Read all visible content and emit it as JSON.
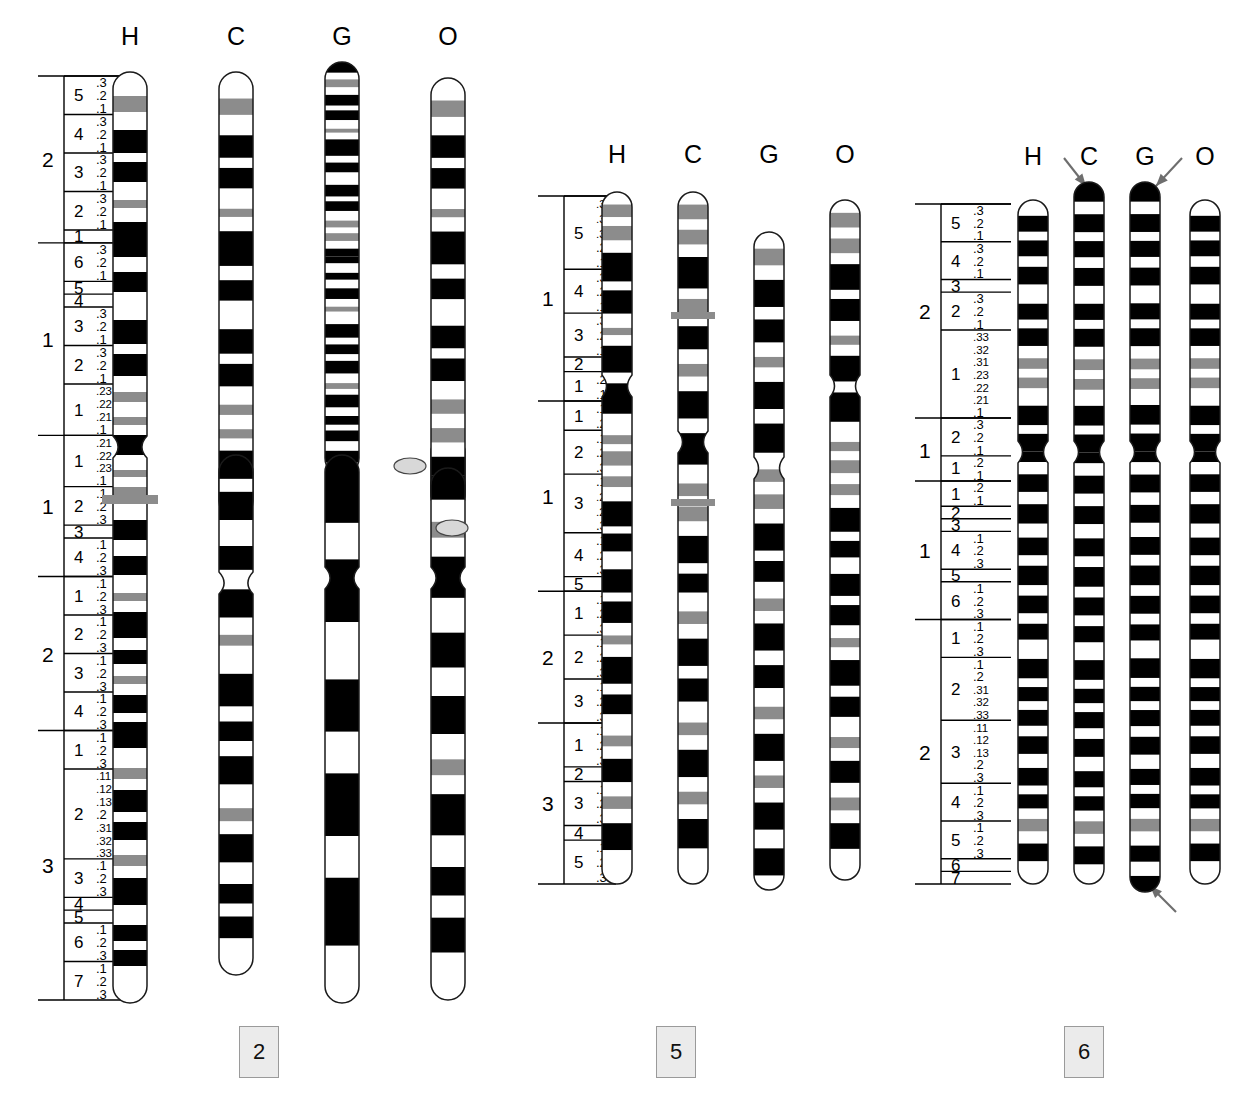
{
  "figure": {
    "type": "ideogram",
    "species_codes": [
      "H",
      "C",
      "G",
      "O"
    ],
    "species_names": {
      "H": "Human",
      "C": "Chimpanzee",
      "G": "Gorilla",
      "O": "Orangutan"
    },
    "band_colors": {
      "negative": "#ffffff",
      "positive": "#000000",
      "variable": "#8c8c8c",
      "outline": "#1a1a1a",
      "chip_fill": "#ebebeb",
      "chip_border": "#9a9a9a",
      "arrow": "#6e6e6e",
      "marker": "#8c8c8c"
    }
  },
  "panels": [
    {
      "id": "chr2",
      "chip_label": "2",
      "headers": [
        "H",
        "C",
        "G",
        "O"
      ],
      "arms": [
        {
          "label": "2",
          "regions": [
            {
              "label": "5",
              "bands": [
                ".3",
                ".2",
                ".1"
              ]
            },
            {
              "label": "4",
              "bands": [
                ".3",
                ".2",
                ".1"
              ]
            },
            {
              "label": "3",
              "bands": [
                ".3",
                ".2",
                ".1"
              ]
            },
            {
              "label": "2",
              "bands": [
                ".3",
                ".2",
                ".1"
              ]
            },
            {
              "label": "1",
              "bands": []
            }
          ]
        },
        {
          "label": "1",
          "regions": [
            {
              "label": "6",
              "bands": [
                ".3",
                ".2",
                ".1"
              ]
            },
            {
              "label": "5",
              "bands": []
            },
            {
              "label": "4",
              "bands": []
            },
            {
              "label": "3",
              "bands": [
                ".3",
                ".2",
                ".1"
              ]
            },
            {
              "label": "2",
              "bands": [
                ".3",
                ".2",
                ".1"
              ]
            },
            {
              "label": "1",
              "bands": [
                ".23",
                ".22",
                ".21",
                ".1"
              ]
            }
          ]
        },
        {
          "label": "1",
          "regions": [
            {
              "label": "1",
              "bands": [
                ".21",
                ".22",
                ".23",
                ".1"
              ]
            },
            {
              "label": "2",
              "bands": [
                ".1",
                ".2",
                ".3"
              ]
            },
            {
              "label": "3",
              "bands": []
            },
            {
              "label": "4",
              "bands": [
                ".1",
                ".2",
                ".3"
              ]
            }
          ]
        },
        {
          "label": "2",
          "regions": [
            {
              "label": "1",
              "bands": [
                ".1",
                ".2",
                ".3"
              ]
            },
            {
              "label": "2",
              "bands": [
                ".1",
                ".2",
                ".3"
              ]
            },
            {
              "label": "3",
              "bands": [
                ".1",
                ".2",
                ".3"
              ]
            },
            {
              "label": "4",
              "bands": [
                ".1",
                ".2",
                ".3"
              ]
            }
          ]
        },
        {
          "label": "3",
          "regions": [
            {
              "label": "1",
              "bands": [
                ".1",
                ".2",
                ".3"
              ]
            },
            {
              "label": "2",
              "bands": [
                ".11",
                ".12",
                ".13",
                ".2",
                ".31",
                ".32",
                ".33"
              ]
            },
            {
              "label": "3",
              "bands": [
                ".1",
                ".2",
                ".3"
              ]
            },
            {
              "label": "4",
              "bands": []
            },
            {
              "label": "5",
              "bands": []
            },
            {
              "label": "6",
              "bands": [
                ".1",
                ".2",
                ".3"
              ]
            },
            {
              "label": "7",
              "bands": [
                ".1",
                ".2",
                ".3"
              ]
            }
          ]
        }
      ]
    },
    {
      "id": "chr5",
      "chip_label": "5",
      "headers": [
        "H",
        "C",
        "G",
        "O"
      ],
      "arms": [
        {
          "label": "1",
          "regions": [
            {
              "label": "5",
              "bands": [
                ".33",
                ".32",
                ".31",
                ".2",
                ".1"
              ]
            },
            {
              "label": "4",
              "bands": [
                ".3",
                ".2",
                ".1"
              ]
            },
            {
              "label": "3",
              "bands": [
                ".3",
                ".2",
                ".1"
              ]
            },
            {
              "label": "2",
              "bands": []
            },
            {
              "label": "1",
              "bands": [
                ".2",
                ".1"
              ]
            }
          ]
        },
        {
          "label": "1",
          "regions": [
            {
              "label": "1",
              "bands": [
                ".1",
                ".2"
              ]
            },
            {
              "label": "2",
              "bands": [
                ".1",
                ".2",
                ".3"
              ]
            },
            {
              "label": "3",
              "bands": [
                ".1",
                ".21",
                ".22",
                ".3"
              ]
            },
            {
              "label": "4",
              "bands": [
                ".1",
                ".2",
                ".3"
              ]
            },
            {
              "label": "5",
              "bands": []
            }
          ]
        },
        {
          "label": "2",
          "regions": [
            {
              "label": "1",
              "bands": [
                ".1",
                ".2",
                ".3"
              ]
            },
            {
              "label": "2",
              "bands": [
                ".1",
                ".2",
                ".3"
              ]
            },
            {
              "label": "3",
              "bands": [
                ".1",
                ".2",
                ".3"
              ]
            }
          ]
        },
        {
          "label": "3",
          "regions": [
            {
              "label": "1",
              "bands": [
                ".1",
                ".2",
                ".3"
              ]
            },
            {
              "label": "2",
              "bands": []
            },
            {
              "label": "3",
              "bands": [
                ".1",
                ".2",
                ".3"
              ]
            },
            {
              "label": "4",
              "bands": []
            },
            {
              "label": "5",
              "bands": [
                ".1",
                ".2",
                ".3"
              ]
            }
          ]
        }
      ]
    },
    {
      "id": "chr6",
      "chip_label": "6",
      "headers": [
        "H",
        "C",
        "G",
        "O"
      ],
      "arms": [
        {
          "label": "2",
          "regions": [
            {
              "label": "5",
              "bands": [
                ".3",
                ".2",
                ".1"
              ]
            },
            {
              "label": "4",
              "bands": [
                ".3",
                ".2",
                ".1"
              ]
            },
            {
              "label": "3",
              "bands": []
            },
            {
              "label": "2",
              "bands": [
                ".3",
                ".2",
                ".1"
              ]
            },
            {
              "label": "1",
              "bands": [
                ".33",
                ".32",
                ".31",
                ".23",
                ".22",
                ".21",
                ".1"
              ]
            }
          ]
        },
        {
          "label": "1",
          "regions": [
            {
              "label": "2",
              "bands": [
                ".3",
                ".2",
                ".1"
              ]
            },
            {
              "label": "1",
              "bands": [
                ".2",
                ".1"
              ]
            }
          ]
        },
        {
          "label": "1",
          "regions": [
            {
              "label": "1",
              "bands": [
                ".2",
                ".1"
              ]
            },
            {
              "label": "2",
              "bands": []
            },
            {
              "label": "3",
              "bands": []
            },
            {
              "label": "4",
              "bands": [
                ".1",
                ".2",
                ".3"
              ]
            },
            {
              "label": "5",
              "bands": []
            },
            {
              "label": "6",
              "bands": [
                ".1",
                ".2",
                ".3"
              ]
            }
          ]
        },
        {
          "label": "2",
          "regions": [
            {
              "label": "1",
              "bands": [
                ".1",
                ".2",
                ".3"
              ]
            },
            {
              "label": "2",
              "bands": [
                ".1",
                ".2",
                ".31",
                ".32",
                ".33"
              ]
            },
            {
              "label": "3",
              "bands": [
                ".11",
                ".12",
                ".13",
                ".2",
                ".3"
              ]
            },
            {
              "label": "4",
              "bands": [
                ".1",
                ".2",
                ".3"
              ]
            },
            {
              "label": "5",
              "bands": [
                ".1",
                ".2",
                ".3"
              ]
            },
            {
              "label": "6",
              "bands": []
            },
            {
              "label": "7",
              "bands": []
            }
          ]
        }
      ]
    }
  ],
  "annotations": {
    "arrows": [
      {
        "id": "arrow-chr6-c-top",
        "panel": "chr6",
        "species": "C",
        "note": "terminal dark band"
      },
      {
        "id": "arrow-chr6-g-top",
        "panel": "chr6",
        "species": "G",
        "note": "terminal dark band"
      },
      {
        "id": "arrow-chr6-g-bottom",
        "panel": "chr6",
        "species": "G",
        "note": "terminal dark band"
      }
    ],
    "markers": [
      {
        "id": "marker-chr2-h",
        "panel": "chr2",
        "species": "H",
        "note": "heteromorphic bar"
      },
      {
        "id": "marker-chr5-c-upper",
        "panel": "chr5",
        "species": "C",
        "note": "heteromorphic bar"
      },
      {
        "id": "marker-chr5-c-lower",
        "panel": "chr5",
        "species": "C",
        "note": "heteromorphic bar"
      }
    ],
    "satellites": [
      {
        "id": "satellite-chr2-o-upper",
        "panel": "chr2",
        "species": "O"
      },
      {
        "id": "satellite-chr2-o-lower",
        "panel": "chr2",
        "species": "O"
      }
    ]
  },
  "chart_data": {
    "type": "ideogram",
    "legend": [
      "H = Human",
      "C = Chimpanzee",
      "G = Gorilla",
      "O = Orangutan"
    ],
    "panel_ids": [
      "2",
      "5",
      "6"
    ],
    "chromosomes": [
      {
        "panel": "2",
        "species": "H",
        "top": 72,
        "bottom": 1003,
        "cenY": 443,
        "bands": [
          [
            72,
            96,
            "w"
          ],
          [
            96,
            112,
            "v"
          ],
          [
            112,
            130,
            "w"
          ],
          [
            130,
            153,
            "k"
          ],
          [
            153,
            162,
            "w"
          ],
          [
            162,
            182,
            "k"
          ],
          [
            182,
            200,
            "w"
          ],
          [
            200,
            208,
            "v"
          ],
          [
            208,
            222,
            "w"
          ],
          [
            222,
            257,
            "k"
          ],
          [
            257,
            272,
            "w"
          ],
          [
            272,
            292,
            "k"
          ],
          [
            292,
            320,
            "w"
          ],
          [
            320,
            344,
            "k"
          ],
          [
            344,
            354,
            "w"
          ],
          [
            354,
            376,
            "k"
          ],
          [
            376,
            392,
            "w"
          ],
          [
            392,
            402,
            "v"
          ],
          [
            402,
            417,
            "w"
          ],
          [
            417,
            425,
            "v"
          ],
          [
            425,
            435,
            "w"
          ],
          [
            435,
            443,
            "k"
          ],
          [
            443,
            455,
            "k"
          ],
          [
            455,
            470,
            "w"
          ],
          [
            470,
            477,
            "v"
          ],
          [
            477,
            487,
            "w"
          ],
          [
            487,
            496,
            "v"
          ],
          [
            496,
            520,
            "w"
          ],
          [
            520,
            540,
            "k"
          ],
          [
            540,
            556,
            "w"
          ],
          [
            556,
            575,
            "k"
          ],
          [
            575,
            593,
            "w"
          ],
          [
            593,
            601,
            "v"
          ],
          [
            601,
            612,
            "w"
          ],
          [
            612,
            638,
            "k"
          ],
          [
            638,
            650,
            "w"
          ],
          [
            650,
            664,
            "k"
          ],
          [
            664,
            676,
            "w"
          ],
          [
            676,
            684,
            "v"
          ],
          [
            684,
            695,
            "w"
          ],
          [
            695,
            713,
            "k"
          ],
          [
            713,
            722,
            "w"
          ],
          [
            722,
            748,
            "k"
          ],
          [
            748,
            768,
            "w"
          ],
          [
            768,
            779,
            "v"
          ],
          [
            779,
            790,
            "w"
          ],
          [
            790,
            812,
            "k"
          ],
          [
            812,
            822,
            "w"
          ],
          [
            822,
            840,
            "k"
          ],
          [
            840,
            855,
            "w"
          ],
          [
            855,
            866,
            "v"
          ],
          [
            866,
            878,
            "w"
          ],
          [
            878,
            905,
            "k"
          ],
          [
            905,
            925,
            "w"
          ],
          [
            925,
            941,
            "k"
          ],
          [
            941,
            950,
            "w"
          ],
          [
            950,
            966,
            "k"
          ],
          [
            966,
            1003,
            "w"
          ]
        ]
      },
      {
        "panel": "2",
        "species": "C",
        "top": 72,
        "bottom": 975,
        "cenY": 443,
        "note": "chimpanzee 2p homolog plus 2q homolog, acrocentric pair"
      },
      {
        "panel": "2",
        "species": "G",
        "top": 62,
        "bottom": 1003,
        "cenY": 443
      },
      {
        "panel": "2",
        "species": "O",
        "top": 78,
        "bottom": 1000,
        "cenY": 470
      },
      {
        "panel": "5",
        "species": "H",
        "top": 192,
        "bottom": 884,
        "cenY": 386
      },
      {
        "panel": "5",
        "species": "C",
        "top": 192,
        "bottom": 884,
        "cenY": 442
      },
      {
        "panel": "5",
        "species": "G",
        "top": 232,
        "bottom": 890,
        "cenY": 468
      },
      {
        "panel": "5",
        "species": "O",
        "top": 200,
        "bottom": 880,
        "cenY": 386
      },
      {
        "panel": "6",
        "species": "H",
        "top": 200,
        "bottom": 884,
        "cenY": 452
      },
      {
        "panel": "6",
        "species": "C",
        "top": 182,
        "bottom": 884,
        "cenY": 452
      },
      {
        "panel": "6",
        "species": "G",
        "top": 182,
        "bottom": 892,
        "cenY": 452
      },
      {
        "panel": "6",
        "species": "O",
        "top": 200,
        "bottom": 884,
        "cenY": 452
      }
    ]
  }
}
